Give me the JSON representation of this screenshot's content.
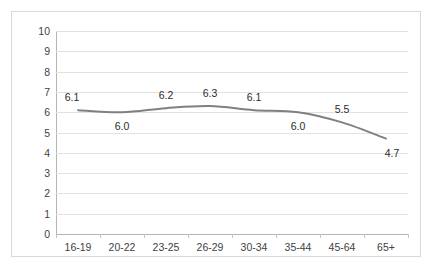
{
  "chart_data": {
    "type": "line",
    "title": "",
    "subtitle": "",
    "xlabel": "",
    "ylabel": "",
    "categories": [
      "16-19",
      "20-22",
      "23-25",
      "26-29",
      "30-34",
      "35-44",
      "45-64",
      "65+"
    ],
    "values": [
      6.1,
      6.0,
      6.2,
      6.3,
      6.1,
      6.0,
      5.5,
      4.7
    ],
    "data_labels": [
      "6.1",
      "6.0",
      "6.2",
      "6.3",
      "6.1",
      "6.0",
      "5.5",
      "4.7"
    ],
    "label_positions": [
      "above",
      "below",
      "above",
      "above",
      "above",
      "below",
      "above",
      "below"
    ],
    "ylim": [
      0,
      10
    ],
    "ytick_labels": [
      "10",
      "9",
      "8",
      "7",
      "6",
      "5",
      "4",
      "3",
      "2",
      "1",
      "0"
    ],
    "ytick_values": [
      10,
      9,
      8,
      7,
      6,
      5,
      4,
      3,
      2,
      1,
      0
    ],
    "grid": true,
    "legend": false,
    "legend_position": "none",
    "smoothed": true,
    "markers": false,
    "series": [
      {
        "name": "",
        "values": [
          6.1,
          6.0,
          6.2,
          6.3,
          6.1,
          6.0,
          5.5,
          4.7
        ]
      }
    ],
    "colors": {
      "line": "#808080",
      "gridline": "#e2e2e2",
      "axis": "#b5b5b5",
      "frame_border": "#d9d9d9",
      "tick_text": "#3f3f3f",
      "label_text": "#2b2b2b",
      "background": "#ffffff"
    }
  }
}
